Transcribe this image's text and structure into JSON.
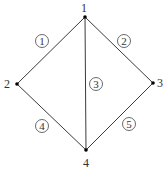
{
  "diagram": {
    "type": "graph",
    "nodes": [
      {
        "id": "1",
        "label": "1",
        "x": 85,
        "y": 17,
        "label_x": 84,
        "label_y": 12
      },
      {
        "id": "2",
        "label": "2",
        "x": 17,
        "y": 84,
        "label_x": 5,
        "label_y": 88
      },
      {
        "id": "3",
        "label": "3",
        "x": 153,
        "y": 83,
        "label_x": 158,
        "label_y": 87
      },
      {
        "id": "4",
        "label": "4",
        "x": 86,
        "y": 150,
        "label_x": 83,
        "label_y": 167
      }
    ],
    "edges": [
      {
        "id": "1",
        "label": "1",
        "from": "1",
        "to": "2",
        "label_x": 42,
        "label_y": 41
      },
      {
        "id": "2",
        "label": "2",
        "from": "1",
        "to": "3",
        "label_x": 124,
        "label_y": 41
      },
      {
        "id": "3",
        "label": "3",
        "from": "1",
        "to": "4",
        "label_x": 96,
        "label_y": 84
      },
      {
        "id": "4",
        "label": "4",
        "from": "2",
        "to": "4",
        "label_x": 42,
        "label_y": 126
      },
      {
        "id": "5",
        "label": "5",
        "from": "3",
        "to": "4",
        "label_x": 129,
        "label_y": 124
      }
    ]
  }
}
